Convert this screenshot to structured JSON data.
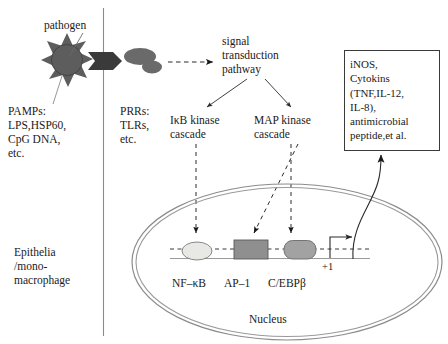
{
  "diagram": {
    "pathogen_label": "pathogen",
    "cell_type_label": "Epithelia\n/mono-\nmacrophage",
    "nucleus_label": "Nucleus",
    "transcription_start_label": "+1"
  },
  "extracellular": {
    "pamps_block": "PAMPs:\nLPS,HSP60,\nCpG DNA,\netc.",
    "pamps_title": "PAMPs:",
    "pamps_items": [
      "LPS,HSP60,",
      "CpG DNA,",
      "etc."
    ]
  },
  "membrane": {
    "prrs_block": "PRRs:\nTLRs,\netc.",
    "prrs_title": "PRRs:",
    "prrs_items": [
      "TLRs,",
      "etc."
    ]
  },
  "cytoplasm": {
    "signal_pathway_label": "signal\ntransduction\npathway",
    "cascades": [
      {
        "name": "ikb-kinase-cascade",
        "label": "IκB kinase\ncascade"
      },
      {
        "name": "map-kinase-cascade",
        "label": "MAP kinase\ncascade"
      }
    ]
  },
  "nucleus": {
    "transcription_factors": [
      {
        "name": "nf-kb",
        "label": "NF–κB",
        "shape": "ellipse",
        "fill": "#e8e8e4"
      },
      {
        "name": "ap-1",
        "label": "AP–1",
        "shape": "rectangle",
        "fill": "#8f8f8f"
      },
      {
        "name": "c-ebp-beta",
        "label": "C/EBPβ",
        "shape": "rounded",
        "fill": "#a2a2a2"
      }
    ]
  },
  "products": {
    "box_text": "iNOS,\nCytokins\n(TNF,IL-12,\nIL-8),\nantimicrobial\npeptide,et al.",
    "lines": [
      "iNOS,",
      "Cytokins",
      "(TNF,IL-12,",
      "IL-8),",
      "antimicrobial",
      "peptide,et al."
    ]
  },
  "colors": {
    "ink": "#1a1a1a",
    "pathogen_fill": "#5d5d5d",
    "receptor_fill": "#6a6a6a",
    "arrow_dark": "#3a3a3a",
    "membrane_line": "#8a8a8a",
    "nucleus_line": "#8c8c8c",
    "dna_line": "#9a9a9a"
  }
}
